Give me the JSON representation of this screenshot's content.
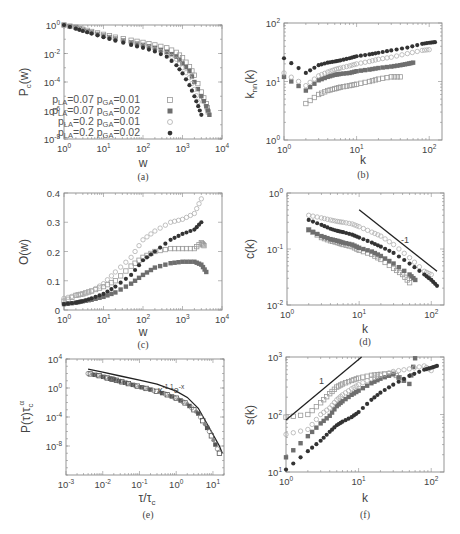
{
  "figure": {
    "panels_count": 6,
    "series_styles": [
      {
        "name": "p_LA=0.07 p_GA=0.01",
        "marker": "open-square",
        "color": "#9a9a9a"
      },
      {
        "name": "p_LA=0.07 p_GA=0.02",
        "marker": "filled-square",
        "color": "#6e6e6e"
      },
      {
        "name": "p_LA=0.2 p_GA=0.01",
        "marker": "open-circle",
        "color": "#b0b0b0"
      },
      {
        "name": "p_LA=0.2 p_GA=0.02",
        "marker": "filled-circle",
        "color": "#333333"
      }
    ]
  },
  "labels": {
    "a": {
      "id": "(a)",
      "xlabel": "w",
      "ylabel_main": "P",
      "ylabel_sub": "c",
      "ylabel_tail": "(w)"
    },
    "b": {
      "id": "(b)",
      "xlabel": "k",
      "ylabel_main": "k",
      "ylabel_sub": "nn",
      "ylabel_tail": "(k)"
    },
    "c": {
      "id": "(c)",
      "xlabel": "w",
      "ylabel": "O(w)"
    },
    "d": {
      "id": "(d)",
      "xlabel": "k",
      "ylabel": "c(k)",
      "annotation": "-1"
    },
    "e": {
      "id": "(e)",
      "xlabel_main": "τ/τ",
      "xlabel_sub": "c",
      "ylabel_main": "P(τ)τ",
      "ylabel_sub": "c",
      "ylabel_sup": "α",
      "annotation_base1": "x",
      "annotation_exp1": "-1.1",
      "annotation_base2": "e",
      "annotation_exp2": "-x"
    },
    "f": {
      "id": "(f)",
      "xlabel": "k",
      "ylabel": "s(k)",
      "annotation": "1"
    }
  },
  "legend": [
    {
      "la": "0.07",
      "ga": "0.01",
      "la_prefix": "p",
      "la_sub": "LA",
      "ga_prefix": "p",
      "ga_sub": "GA",
      "text_la": "=0.07",
      "text_ga": "=0.01"
    },
    {
      "la": "0.07",
      "ga": "0.02",
      "la_prefix": "p",
      "la_sub": "LA",
      "ga_prefix": "p",
      "ga_sub": "GA",
      "text_la": "=0.07",
      "text_ga": "=0.02"
    },
    {
      "la": "0.2",
      "ga": "0.01",
      "la_prefix": "p",
      "la_sub": "LA",
      "ga_prefix": "p",
      "ga_sub": "GA",
      "text_la": "=0.2",
      "text_ga": "=0.01"
    },
    {
      "la": "0.2",
      "ga": "0.02",
      "la_prefix": "p",
      "la_sub": "LA",
      "ga_prefix": "p",
      "ga_sub": "GA",
      "text_la": "=0.2",
      "text_ga": "=0.02"
    }
  ],
  "chart_data": [
    {
      "panel": "a",
      "type": "scatter",
      "title": "",
      "xlabel": "w",
      "ylabel": "P_c(w)",
      "xscale": "log",
      "yscale": "log",
      "xlim": [
        1,
        10000
      ],
      "ylim": [
        1e-08,
        1
      ],
      "xticks": [
        "10^0",
        "10^1",
        "10^2",
        "10^3",
        "10^4"
      ],
      "yticks": [
        "10^0",
        "10^-2",
        "10^-4",
        "10^-6",
        "10^-8"
      ],
      "legend_position": "lower left",
      "series": [
        {
          "name": "p_LA=0.07 p_GA=0.01",
          "marker": "open-square",
          "x": [
            1,
            2,
            3,
            5,
            10,
            20,
            50,
            100,
            200,
            400,
            700,
            1000,
            1500,
            2000,
            3000,
            4000,
            4500
          ],
          "y": [
            1,
            0.7,
            0.5,
            0.35,
            0.22,
            0.14,
            0.085,
            0.06,
            0.04,
            0.025,
            0.012,
            0.005,
            0.0012,
            0.0003,
            2e-05,
            3e-06,
            8e-07
          ]
        },
        {
          "name": "p_LA=0.07 p_GA=0.02",
          "marker": "filled-square",
          "x": [
            1,
            2,
            3,
            5,
            10,
            20,
            50,
            100,
            200,
            400,
            700,
            1000,
            1500,
            2000,
            3000,
            4000,
            4800
          ],
          "y": [
            1,
            0.65,
            0.45,
            0.3,
            0.18,
            0.11,
            0.06,
            0.04,
            0.025,
            0.013,
            0.006,
            0.002,
            0.0006,
            0.0001,
            1e-05,
            2e-06,
            5e-07
          ]
        },
        {
          "name": "p_LA=0.2 p_GA=0.01",
          "marker": "open-circle",
          "x": [
            1,
            2,
            3,
            5,
            10,
            20,
            50,
            100,
            200,
            400,
            700,
            1000,
            1500,
            2000,
            2500
          ],
          "y": [
            1,
            0.6,
            0.42,
            0.28,
            0.17,
            0.1,
            0.055,
            0.035,
            0.02,
            0.01,
            0.004,
            0.001,
            0.0002,
            3e-05,
            4e-06
          ]
        },
        {
          "name": "p_LA=0.2 p_GA=0.02",
          "marker": "filled-circle",
          "x": [
            1,
            2,
            3,
            5,
            10,
            20,
            50,
            100,
            200,
            400,
            700,
            1000,
            1500,
            2000,
            2500,
            3000
          ],
          "y": [
            1,
            0.55,
            0.38,
            0.25,
            0.14,
            0.08,
            0.04,
            0.025,
            0.014,
            0.006,
            0.0015,
            0.0004,
            6e-05,
            1e-05,
            2e-06,
            5e-07
          ]
        }
      ]
    },
    {
      "panel": "b",
      "type": "scatter",
      "title": "",
      "xlabel": "k",
      "ylabel": "k_nn(k)",
      "xscale": "log",
      "yscale": "log",
      "xlim": [
        1,
        150
      ],
      "ylim": [
        1,
        100
      ],
      "xticks": [
        "10^0",
        "10^1",
        "10^2"
      ],
      "yticks": [
        "10^0",
        "10^1",
        "10^2"
      ],
      "series": [
        {
          "name": "p_LA=0.07 p_GA=0.01",
          "marker": "open-square",
          "x": [
            2,
            3,
            4,
            5,
            6,
            8,
            10,
            15,
            20,
            30,
            40
          ],
          "y": [
            4.2,
            6,
            7,
            7.5,
            8,
            8.5,
            9,
            10,
            11,
            12,
            12
          ]
        },
        {
          "name": "p_LA=0.07 p_GA=0.02",
          "marker": "filled-square",
          "x": [
            1,
            2,
            3,
            4,
            5,
            6,
            8,
            10,
            15,
            20,
            30,
            40,
            50,
            60
          ],
          "y": [
            12,
            7,
            10.5,
            12,
            13,
            13.5,
            14,
            15,
            16,
            17,
            18,
            19,
            20,
            21
          ]
        },
        {
          "name": "p_LA=0.2 p_GA=0.01",
          "marker": "open-circle",
          "x": [
            1,
            2,
            3,
            4,
            5,
            6,
            8,
            10,
            15,
            20,
            30,
            50,
            80,
            100
          ],
          "y": [
            14,
            8.5,
            12.5,
            14.5,
            16,
            17,
            18.5,
            20,
            22,
            24,
            26,
            30,
            34,
            35
          ]
        },
        {
          "name": "p_LA=0.2 p_GA=0.02",
          "marker": "filled-circle",
          "x": [
            1,
            2,
            3,
            4,
            5,
            6,
            8,
            10,
            15,
            20,
            30,
            50,
            80,
            100,
            120
          ],
          "y": [
            25,
            14,
            19,
            21,
            22,
            23,
            25,
            27,
            29,
            31,
            34,
            38,
            44,
            46,
            47
          ]
        }
      ]
    },
    {
      "panel": "c",
      "type": "scatter",
      "title": "",
      "xlabel": "w",
      "ylabel": "O(w)",
      "xscale": "log",
      "yscale": "linear",
      "xlim": [
        1,
        10000
      ],
      "ylim": [
        0,
        0.4
      ],
      "xticks": [
        "10^0",
        "10^1",
        "10^2",
        "10^3",
        "10^4"
      ],
      "yticks": [
        "0",
        "0.1",
        "0.2",
        "0.3",
        "0.4"
      ],
      "series": [
        {
          "name": "p_LA=0.07 p_GA=0.01",
          "marker": "open-square",
          "x": [
            1,
            2,
            3,
            5,
            10,
            20,
            50,
            100,
            200,
            500,
            1000,
            2000,
            3000,
            3500
          ],
          "y": [
            0.03,
            0.05,
            0.055,
            0.065,
            0.08,
            0.1,
            0.15,
            0.18,
            0.2,
            0.21,
            0.21,
            0.21,
            0.23,
            0.22
          ]
        },
        {
          "name": "p_LA=0.07 p_GA=0.02",
          "marker": "filled-square",
          "x": [
            1,
            2,
            3,
            5,
            10,
            20,
            50,
            100,
            200,
            500,
            1000,
            2000,
            3000,
            4000
          ],
          "y": [
            0.02,
            0.025,
            0.03,
            0.035,
            0.045,
            0.06,
            0.09,
            0.12,
            0.145,
            0.16,
            0.165,
            0.165,
            0.155,
            0.13
          ]
        },
        {
          "name": "p_LA=0.2 p_GA=0.01",
          "marker": "open-circle",
          "x": [
            1,
            2,
            3,
            5,
            10,
            20,
            50,
            100,
            200,
            500,
            1000,
            2000,
            3000
          ],
          "y": [
            0.04,
            0.05,
            0.055,
            0.065,
            0.09,
            0.13,
            0.18,
            0.24,
            0.27,
            0.3,
            0.31,
            0.33,
            0.38
          ]
        },
        {
          "name": "p_LA=0.2 p_GA=0.02",
          "marker": "filled-circle",
          "x": [
            1,
            2,
            3,
            5,
            10,
            20,
            50,
            100,
            200,
            500,
            1000,
            2000,
            3000
          ],
          "y": [
            0.02,
            0.025,
            0.03,
            0.04,
            0.055,
            0.08,
            0.12,
            0.17,
            0.2,
            0.24,
            0.26,
            0.275,
            0.3
          ]
        }
      ]
    },
    {
      "panel": "d",
      "type": "scatter",
      "title": "",
      "xlabel": "k",
      "ylabel": "c(k)",
      "xscale": "log",
      "yscale": "log",
      "xlim": [
        1,
        150
      ],
      "ylim": [
        0.01,
        1
      ],
      "xticks": [
        "10^0",
        "10^1",
        "10^2"
      ],
      "yticks": [
        "10^0",
        "10^-1",
        "10^-2"
      ],
      "annotations": [
        {
          "text": "-1",
          "type": "reference slope line",
          "x": [
            10,
            120
          ],
          "y": [
            0.5,
            0.04
          ]
        }
      ],
      "series": [
        {
          "name": "p_LA=0.07 p_GA=0.01",
          "marker": "open-square",
          "x": [
            2,
            3,
            4,
            5,
            6,
            8,
            10,
            15,
            20,
            30,
            40,
            50
          ],
          "y": [
            0.22,
            0.16,
            0.14,
            0.13,
            0.12,
            0.11,
            0.095,
            0.08,
            0.065,
            0.045,
            0.035,
            0.025
          ]
        },
        {
          "name": "p_LA=0.07 p_GA=0.02",
          "marker": "filled-square",
          "x": [
            2,
            3,
            4,
            5,
            6,
            8,
            10,
            15,
            20,
            30,
            50,
            60
          ],
          "y": [
            0.22,
            0.17,
            0.15,
            0.14,
            0.13,
            0.12,
            0.105,
            0.09,
            0.075,
            0.055,
            0.035,
            0.028
          ]
        },
        {
          "name": "p_LA=0.2 p_GA=0.01",
          "marker": "open-circle",
          "x": [
            2,
            3,
            4,
            5,
            6,
            8,
            10,
            15,
            20,
            30,
            50,
            80,
            100
          ],
          "y": [
            0.4,
            0.36,
            0.33,
            0.31,
            0.3,
            0.28,
            0.25,
            0.2,
            0.17,
            0.12,
            0.07,
            0.04,
            0.035
          ]
        },
        {
          "name": "p_LA=0.2 p_GA=0.02",
          "marker": "filled-circle",
          "x": [
            2,
            3,
            4,
            5,
            6,
            8,
            10,
            15,
            20,
            30,
            50,
            80,
            100,
            120
          ],
          "y": [
            0.33,
            0.27,
            0.23,
            0.21,
            0.2,
            0.18,
            0.16,
            0.13,
            0.11,
            0.085,
            0.055,
            0.035,
            0.028,
            0.022
          ]
        }
      ]
    },
    {
      "panel": "e",
      "type": "scatter",
      "title": "",
      "xlabel": "τ/τ_c",
      "ylabel": "P(τ)τ_c^α",
      "xscale": "log",
      "yscale": "log",
      "xlim": [
        0.001,
        20
      ],
      "ylim": [
        1e-12,
        10000
      ],
      "xticks": [
        "10^-3",
        "10^-2",
        "10^-1",
        "10^0",
        "10^1"
      ],
      "yticks": [
        "10^4",
        "10^0",
        "10^-4",
        "10^-8"
      ],
      "annotations": [
        {
          "text": "x^-1.1 e^-x",
          "type": "fit curve label"
        }
      ],
      "fit_curve": {
        "formula": "x^-1.1 * exp(-x)",
        "x": [
          0.004,
          0.01,
          0.03,
          0.1,
          0.3,
          1,
          2,
          4,
          8,
          15,
          18
        ],
        "y": [
          400,
          150,
          45,
          12,
          3.5,
          0.37,
          0.05,
          0.0016,
          3e-06,
          1e-08,
          1e-09
        ]
      },
      "series": [
        {
          "name": "collapsed data (all parameters)",
          "marker": "mixed",
          "x": [
            0.004,
            0.008,
            0.015,
            0.02,
            0.03,
            0.05,
            0.1,
            0.2,
            0.5,
            1,
            2,
            4,
            8,
            15
          ],
          "y": [
            100,
            50,
            20,
            15,
            8,
            4,
            1.5,
            0.6,
            0.15,
            0.04,
            0.006,
            0.0003,
            1e-06,
            1e-09
          ]
        }
      ]
    },
    {
      "panel": "f",
      "type": "scatter",
      "title": "",
      "xlabel": "k",
      "ylabel": "s(k)",
      "xscale": "log",
      "yscale": "log",
      "xlim": [
        1,
        150
      ],
      "ylim": [
        10,
        1000
      ],
      "xticks": [
        "10^0",
        "10^1",
        "10^2"
      ],
      "yticks": [
        "10^1",
        "10^2",
        "10^3"
      ],
      "annotations": [
        {
          "text": "1",
          "type": "reference slope line",
          "x": [
            1,
            11
          ],
          "y": [
            80,
            1000
          ]
        }
      ],
      "series": [
        {
          "name": "p_LA=0.07 p_GA=0.01",
          "marker": "open-square",
          "x": [
            1,
            2,
            3,
            4,
            5,
            6,
            8,
            10,
            15,
            20,
            30,
            40
          ],
          "y": [
            90,
            100,
            160,
            230,
            300,
            340,
            390,
            430,
            480,
            500,
            520,
            400
          ]
        },
        {
          "name": "p_LA=0.07 p_GA=0.02",
          "marker": "filled-square",
          "x": [
            1,
            2,
            3,
            4,
            5,
            6,
            8,
            10,
            15,
            20,
            30,
            50,
            60
          ],
          "y": [
            18,
            42,
            70,
            95,
            140,
            170,
            220,
            260,
            350,
            420,
            500,
            340,
            950
          ]
        },
        {
          "name": "p_LA=0.2 p_GA=0.01",
          "marker": "open-circle",
          "x": [
            1,
            2,
            3,
            4,
            5,
            6,
            8,
            10,
            15,
            20,
            30,
            50,
            80,
            100
          ],
          "y": [
            45,
            55,
            100,
            130,
            180,
            220,
            280,
            330,
            420,
            480,
            560,
            620,
            700,
            580
          ]
        },
        {
          "name": "p_LA=0.2 p_GA=0.02",
          "marker": "filled-circle",
          "x": [
            1,
            2,
            3,
            4,
            5,
            6,
            8,
            10,
            15,
            20,
            30,
            50,
            80,
            100,
            120
          ],
          "y": [
            11,
            23,
            35,
            50,
            65,
            75,
            90,
            110,
            180,
            240,
            330,
            470,
            600,
            650,
            700
          ]
        }
      ]
    }
  ]
}
